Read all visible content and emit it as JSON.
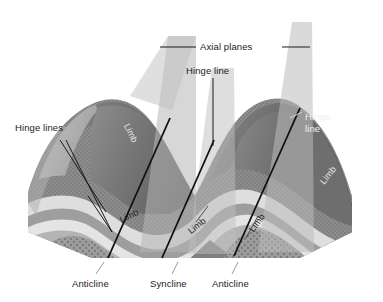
{
  "figure": {
    "canvas": {
      "width": 383,
      "height": 302
    },
    "background_color": "#ffffff"
  },
  "labels": {
    "axial_planes": "Axial planes",
    "hinge_line_top": "Hinge line",
    "hinge_lines_left": "Hinge lines",
    "hinge_line_right_l1": "Hinge",
    "hinge_line_right_l2": "line",
    "limb_upper_left": "Limb",
    "limb_front_left": "Limb",
    "limb_front_center": "Limb",
    "limb_front_right": "Limb",
    "limb_right_face": "Limb",
    "anticline_left": "Anticline",
    "syncline_center": "Syncline",
    "anticline_right": "Anticline"
  },
  "colors": {
    "axial_plane_fill": "#b9b9b9",
    "hinge_line_stroke": "#111111",
    "leader_line_stroke": "#1b1b1b",
    "label_text": "#1b1b1b",
    "label_text_light": "#efefef",
    "fold_crest_dark": "#6f6f6f",
    "fold_crest_darker": "#5f5f5f",
    "front_face_light": "#d8d8d8",
    "front_face_mid": "#9a9a9a",
    "front_face_stipple": "#8a8a8a",
    "core_dotted": "#909090",
    "side_face_gray": "#a8a8a8"
  },
  "strata": {
    "band_order_outer_to_core": [
      {
        "name": "outer-stipple",
        "color": "#8f8f8f",
        "pattern": "stipple"
      },
      {
        "name": "light-band-1",
        "color": "#dcdcdc",
        "pattern": "solid"
      },
      {
        "name": "mid-gray-band",
        "color": "#a0a0a0",
        "pattern": "solid"
      },
      {
        "name": "light-band-2",
        "color": "#e3e3e3",
        "pattern": "solid"
      },
      {
        "name": "dark-band",
        "color": "#7d7d7d",
        "pattern": "solid"
      },
      {
        "name": "core-dotted",
        "color": "#9a9a9a",
        "pattern": "dots"
      }
    ]
  },
  "structures": {
    "anticlines": 2,
    "synclines": 1,
    "axial_planes": 2,
    "hinge_lines": 3,
    "limbs_labeled": 5
  }
}
